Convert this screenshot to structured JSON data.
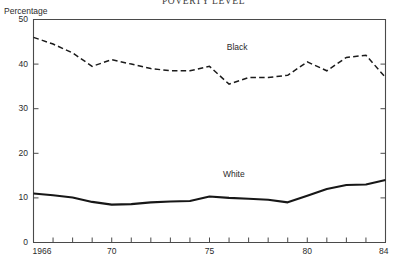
{
  "chart_data": {
    "type": "line",
    "title": "POVERTY LEVEL",
    "xlabel": "",
    "ylabel": "Percentage",
    "ylim": [
      0,
      50
    ],
    "xlim": [
      1966,
      1984
    ],
    "yticks": [
      "0",
      "10",
      "20",
      "30",
      "40",
      "50"
    ],
    "ytick_values": [
      0,
      10,
      20,
      30,
      40,
      50
    ],
    "xticks": [
      "1966",
      "70",
      "75",
      "80",
      "84"
    ],
    "xtick_values": [
      1966,
      1970,
      1975,
      1980,
      1984
    ],
    "grid": false,
    "legend_position": "inline-labels",
    "x": [
      1966,
      1967,
      1968,
      1969,
      1970,
      1971,
      1972,
      1973,
      1974,
      1975,
      1976,
      1977,
      1978,
      1979,
      1980,
      1981,
      1982,
      1983,
      1984
    ],
    "series": [
      {
        "name": "Black",
        "style": "dashed",
        "color": "#1b1b1b",
        "values": [
          46.0,
          44.5,
          42.5,
          39.5,
          41.0,
          40.0,
          39.0,
          38.5,
          38.5,
          39.5,
          35.5,
          37.0,
          37.0,
          37.5,
          40.5,
          38.5,
          41.5,
          42.0,
          37.0
        ]
      },
      {
        "name": "White",
        "style": "solid",
        "color": "#171717",
        "values": [
          11.0,
          10.6,
          10.1,
          9.1,
          8.5,
          8.6,
          9.0,
          9.2,
          9.3,
          10.3,
          10.0,
          9.8,
          9.6,
          9.0,
          10.5,
          12.0,
          12.9,
          13.0,
          14.0
        ]
      }
    ]
  }
}
